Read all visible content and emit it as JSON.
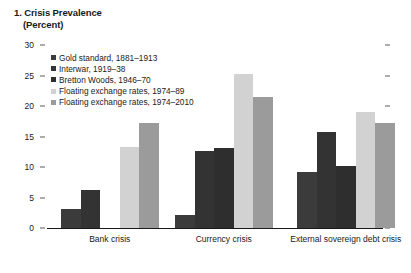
{
  "title": {
    "main": "1. Crisis Prevalence",
    "unit": "(Percent)"
  },
  "chart_data": {
    "type": "bar",
    "title": "1. Crisis Prevalence",
    "subtitle": "(Percent)",
    "xlabel": "",
    "ylabel": "Percent",
    "ylim": [
      0,
      30
    ],
    "yticks": [
      0,
      5,
      10,
      15,
      20,
      25,
      30
    ],
    "grid": false,
    "legend_position": "top-left",
    "categories": [
      "Bank crisis",
      "Currency crisis",
      "External sovereign debt crisis"
    ],
    "series": [
      {
        "name": "Gold standard, 1881–1913",
        "color": "#3b3b3b",
        "values": [
          3.1,
          2.1,
          9.2
        ]
      },
      {
        "name": "Interwar, 1919–38",
        "color": "#333333",
        "values": [
          6.2,
          12.6,
          15.8
        ]
      },
      {
        "name": "Bretton Woods, 1946–70",
        "color": "#2e2e2e",
        "values": [
          0,
          13.1,
          10.2
        ]
      },
      {
        "name": "Floating exchange rates, 1974–89",
        "color": "#d2d2d2",
        "values": [
          13.2,
          25.3,
          19.0
        ]
      },
      {
        "name": "Floating exchange rates, 1974–2010",
        "color": "#9b9b9b",
        "values": [
          17.2,
          21.5,
          17.2
        ]
      }
    ]
  },
  "axis": {
    "tick_labels": [
      "30",
      "25",
      "20",
      "15",
      "10",
      "5",
      "0"
    ]
  }
}
